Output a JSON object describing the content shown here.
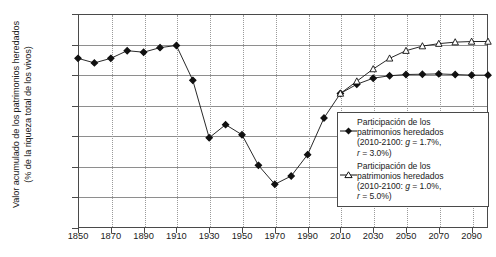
{
  "chart_data": {
    "type": "line",
    "title": "",
    "xlabel": "",
    "ylabel": "Valor acumulado de los patrimonios heredados (% de la riqueza total de los vivos)",
    "ylabel_line1": "Valor acumulado de los patrimonios heredados",
    "ylabel_line2": "(% de la riqueza total de los vivos)",
    "xlim": [
      1850,
      2100
    ],
    "ylim": [
      30,
      100
    ],
    "grid": "horizontal solid, vertical dotted",
    "legend_position": "right-inside",
    "y_ticks": [
      "30%",
      "40%",
      "50%",
      "60%",
      "70%",
      "80%",
      "90%",
      "100%"
    ],
    "y_tick_values": [
      30,
      40,
      50,
      60,
      70,
      80,
      90,
      100
    ],
    "x_ticks": [
      "1850",
      "1870",
      "1890",
      "1910",
      "1930",
      "1950",
      "1970",
      "1990",
      "2010",
      "2030",
      "2050",
      "2070",
      "2090"
    ],
    "x_tick_values": [
      1850,
      1870,
      1890,
      1910,
      1930,
      1950,
      1970,
      1990,
      2010,
      2030,
      2050,
      2070,
      2090
    ],
    "series": [
      {
        "name": "Participación de los patrimonios heredados (2010-2100: g = 1.7%, r = 3.0%)",
        "marker": "filled-diamond",
        "color": "#111111",
        "x": [
          1850,
          1860,
          1870,
          1880,
          1890,
          1900,
          1910,
          1920,
          1930,
          1940,
          1950,
          1960,
          1970,
          1980,
          1990,
          2000,
          2010,
          2020,
          2030,
          2040,
          2050,
          2060,
          2070,
          2080,
          2090,
          2100
        ],
        "values": [
          85.5,
          84.0,
          85.5,
          88.0,
          87.5,
          89.0,
          89.7,
          78.3,
          59.5,
          63.8,
          60.5,
          50.5,
          44.3,
          47.0,
          54.0,
          66.0,
          74.0,
          77.0,
          79.0,
          79.8,
          80.2,
          80.3,
          80.4,
          80.2,
          80.0,
          80.0
        ]
      },
      {
        "name": "Participación de los patrimonios heredados (2010-2100: g = 1.0%, r = 5.0%)",
        "marker": "hollow-triangle",
        "color": "#111111",
        "x": [
          2010,
          2020,
          2030,
          2040,
          2050,
          2060,
          2070,
          2080,
          2090,
          2100
        ],
        "values": [
          74.0,
          78.0,
          82.0,
          85.5,
          88.0,
          89.5,
          90.3,
          90.8,
          91.0,
          91.0
        ]
      }
    ]
  },
  "legend": {
    "entries": [
      {
        "marker": "filled-diamond",
        "line1": "Participación de los",
        "line2": "patrimonios heredados",
        "line3_pre": "(2010-2100: ",
        "line3_g": "g",
        "line3_mid": " = 1.7%,",
        "line4_r": "r",
        "line4_post": " = 3.0%)"
      },
      {
        "marker": "hollow-triangle",
        "line1": "Participación de los",
        "line2": "patrimonios heredados",
        "line3_pre": "(2010-2100: ",
        "line3_g": "g",
        "line3_mid": " = 1.0%,",
        "line4_r": "r",
        "line4_post": " = 5.0%)"
      }
    ]
  }
}
